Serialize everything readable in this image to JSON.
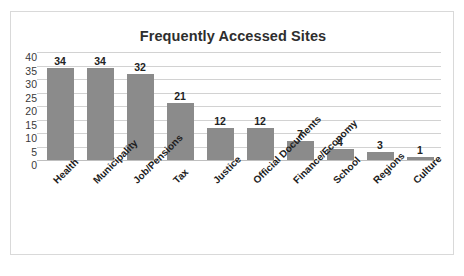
{
  "chart_data": {
    "type": "bar",
    "title": "Frequently Accessed Sites",
    "xlabel": "",
    "ylabel": "",
    "ylim": [
      0,
      40
    ],
    "yticks": [
      40,
      35,
      30,
      25,
      20,
      15,
      10,
      5,
      0
    ],
    "grid": true,
    "legend": "none",
    "bar_color": "#8b8b8b",
    "categories": [
      "Health",
      "Municipality",
      "Job/Pensions",
      "Tax",
      "Justice",
      "Official Documents",
      "Finance/Economy",
      "School",
      "Regions",
      "Culture"
    ],
    "values": [
      34,
      34,
      32,
      21,
      12,
      12,
      7,
      4,
      3,
      1
    ],
    "data_labels": [
      "34",
      "34",
      "32",
      "21",
      "12",
      "12",
      "7",
      "4",
      "3",
      "1"
    ]
  }
}
